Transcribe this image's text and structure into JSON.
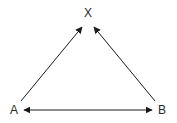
{
  "diagram": {
    "nodes": [
      {
        "id": "X",
        "label": "X",
        "x": 88,
        "y": 17
      },
      {
        "id": "A",
        "label": "A",
        "x": 14,
        "y": 114
      },
      {
        "id": "B",
        "label": "B",
        "x": 162,
        "y": 114
      }
    ],
    "edges": [
      {
        "from": "A",
        "to": "X",
        "direction": "one-way"
      },
      {
        "from": "B",
        "to": "X",
        "direction": "one-way"
      },
      {
        "from": "A",
        "to": "B",
        "direction": "two-way"
      }
    ],
    "colors": {
      "line": "#1a1a1a",
      "text": "#2a2a2a",
      "background": "#ffffff"
    }
  }
}
